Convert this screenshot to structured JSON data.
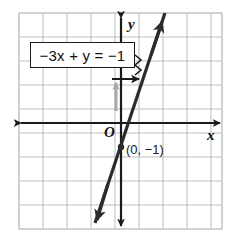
{
  "figure": {
    "background_color": "#ffffff",
    "grid": {
      "color": "#b9b9b9",
      "spacing_px": 24,
      "left_px": 19,
      "top_px": 13,
      "right_px": 222,
      "bottom_px": 232,
      "border_color": "#c9c9c9",
      "visible": true
    },
    "axes": {
      "color": "#1a1a1a",
      "origin_px": {
        "x": 121,
        "y": 123
      },
      "x_axis": {
        "label": "x",
        "y_px": 123,
        "start_px": 21,
        "end_px": 220,
        "arrows": "both"
      },
      "y_axis": {
        "label": "y",
        "x_px": 121,
        "start_px": 18,
        "end_px": 226,
        "arrows": "both"
      },
      "origin_label": "O"
    },
    "line": {
      "equation_label": "−3x + y = −1",
      "equation_parts": {
        "coefficient_term": "−3",
        "x_var": "x",
        "plus": "+",
        "y_var": "y",
        "equals": "=",
        "constant": "−1"
      },
      "slope": 3,
      "y_intercept": -1,
      "color": "#2b2b2b",
      "width_px": 3.2,
      "arrows": "both",
      "top_arrow_px": {
        "x": 161,
        "y": 17
      },
      "bottom_arrow_px": {
        "x": 96,
        "y": 226
      }
    },
    "points": [
      {
        "label": "(0, −1)",
        "coords": {
          "x": 0,
          "y": -1
        },
        "px": {
          "x": 121,
          "y": 147
        },
        "marker_color": "#2b2b2b",
        "label_px": {
          "x": 128,
          "y": 150
        }
      }
    ],
    "callout": {
      "text": "−3x + y = −1",
      "box_px": {
        "x": 30,
        "y": 42,
        "w": 105,
        "h": 26
      },
      "border_color": "#1a1a1a",
      "fill_color": "#ffffff",
      "pointer_arrow_color": "#1a1a1a",
      "pointer_target_px": {
        "x": 143,
        "y": 79
      }
    },
    "guide_arrow": {
      "color": "#a8a8a8",
      "from_px": {
        "x": 116,
        "y": 111
      },
      "to_px": {
        "x": 116,
        "y": 80
      },
      "direction": "up"
    }
  }
}
